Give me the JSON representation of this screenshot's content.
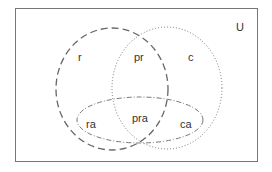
{
  "diagram": {
    "type": "venn",
    "universe_label": "U",
    "sets": [
      {
        "name": "r",
        "style": "dashed"
      },
      {
        "name": "c",
        "style": "dotted"
      },
      {
        "name": "a",
        "style": "dash-dot"
      }
    ],
    "regions": {
      "r": "r",
      "pr": "pr",
      "c": "c",
      "ra": "ra",
      "pra": "pra",
      "ca": "ca"
    },
    "colors": {
      "border": "#777777",
      "stroke": "#666666",
      "text": "#333333"
    }
  }
}
